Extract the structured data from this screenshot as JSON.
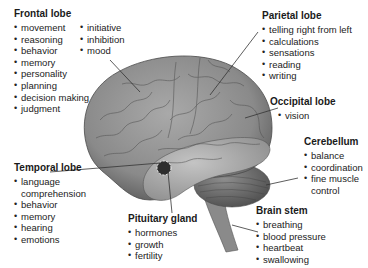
{
  "diagram": {
    "colors": {
      "text": "#222222",
      "brain_light": "#b8b8b8",
      "brain_mid": "#8c8c8c",
      "brain_dark": "#555555",
      "leader_line": "#333333"
    }
  },
  "regions": {
    "frontal": {
      "title": "Frontal lobe",
      "items_col1": [
        "movement",
        "reasoning",
        "behavior",
        "memory",
        "personality",
        "planning",
        "decision making",
        "judgment"
      ],
      "items_col2": [
        "initiative",
        "inhibition",
        "mood"
      ]
    },
    "parietal": {
      "title": "Parietal lobe",
      "items": [
        "telling right from left",
        "calculations",
        "sensations",
        "reading",
        "writing"
      ]
    },
    "occipital": {
      "title": "Occipital lobe",
      "items": [
        "vision"
      ]
    },
    "cerebellum": {
      "title": "Cerebellum",
      "items": [
        "balance",
        "coordination",
        "fine muscle control"
      ]
    },
    "temporal": {
      "title": "Temporal lobe",
      "items": [
        "language comprehension",
        "behavior",
        "memory",
        "hearing",
        "emotions"
      ]
    },
    "pituitary": {
      "title": "Pituitary gland",
      "items": [
        "hormones",
        "growth",
        "fertility"
      ]
    },
    "brainstem": {
      "title": "Brain stem",
      "items": [
        "breathing",
        "blood pressure",
        "heartbeat",
        "swallowing"
      ]
    }
  }
}
